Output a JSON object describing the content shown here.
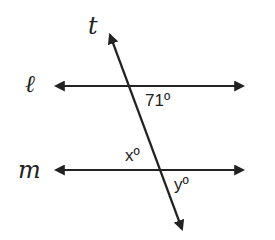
{
  "diagram": {
    "type": "parallel-lines-transversal",
    "colors": {
      "stroke": "#222222",
      "background": "#ffffff"
    },
    "lines": {
      "l": {
        "label": "ℓ",
        "y": 86,
        "x1": 52,
        "x2": 247
      },
      "m": {
        "label": "m",
        "y": 170,
        "x1": 52,
        "x2": 247
      },
      "t": {
        "label": "t",
        "x1": 108,
        "y1": 30,
        "x2": 184,
        "y2": 234
      }
    },
    "angles": {
      "given": "71º",
      "x": "xº",
      "y": "yº"
    }
  }
}
